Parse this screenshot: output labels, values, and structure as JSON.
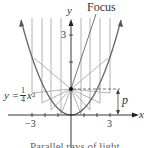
{
  "figure": {
    "focus_label": "Focus",
    "y_axis_label": "y",
    "x_axis_label": "x",
    "equation": {
      "lhs": "y = ",
      "num": "1",
      "den": "4",
      "var": "x",
      "exp": "2"
    },
    "p_label": "p",
    "ticks": {
      "y3": "3",
      "xneg3": "−3",
      "x3": "3"
    },
    "caption": "Parallel rays of light"
  },
  "colors": {
    "axis": "#222222",
    "curve": "#666666",
    "rays": "#999999",
    "dash": "#555555"
  }
}
